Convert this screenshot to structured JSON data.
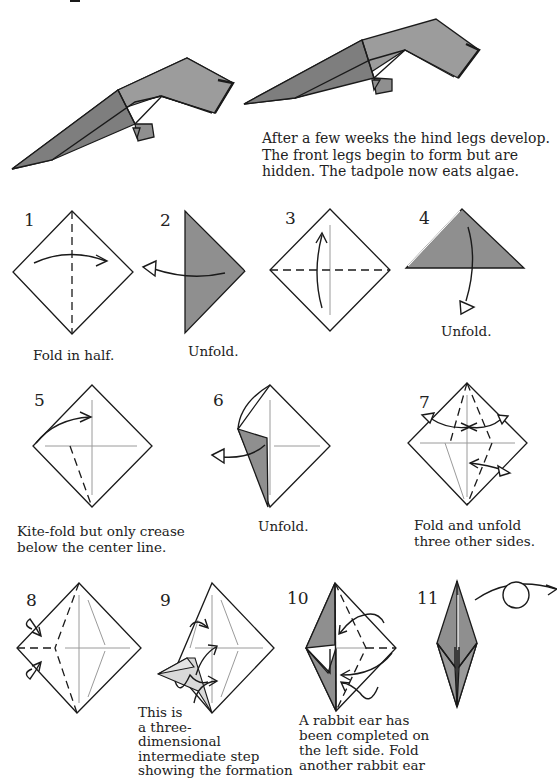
{
  "tadpole": {
    "description": "After a few weeks the hind legs develop. The front legs begin to form but are hidden. The tadpole now eats algae.",
    "lines": [
      "After a few weeks the hind legs develop.",
      "The front legs begin to form but are",
      "hidden. The tadpole now eats algae."
    ]
  },
  "steps": [
    {
      "number": "1",
      "caption": "Fold in half."
    },
    {
      "number": "2",
      "caption": "Unfold."
    },
    {
      "number": "3",
      "caption": ""
    },
    {
      "number": "4",
      "caption": "Unfold."
    },
    {
      "number": "5",
      "caption_lines": [
        "Kite-fold but only crease",
        "below the center line."
      ]
    },
    {
      "number": "6",
      "caption": "Unfold."
    },
    {
      "number": "7",
      "caption_lines": [
        "Fold and unfold",
        "three other sides."
      ]
    },
    {
      "number": "8",
      "caption": ""
    },
    {
      "number": "9",
      "caption_lines": [
        "This is",
        "a three-",
        "dimensional",
        "intermediate step",
        "showing the formation"
      ]
    },
    {
      "number": "10",
      "caption_lines": [
        "A rabbit ear has",
        "been completed on",
        "the left side. Fold",
        "another rabbit ear"
      ]
    },
    {
      "number": "11",
      "caption": ""
    }
  ],
  "colors": {
    "paper_colored_side": "#8f8f8f",
    "paper_white_side": "#ffffff",
    "line": "#1a1a1a",
    "crease": "#9a9a9a"
  }
}
